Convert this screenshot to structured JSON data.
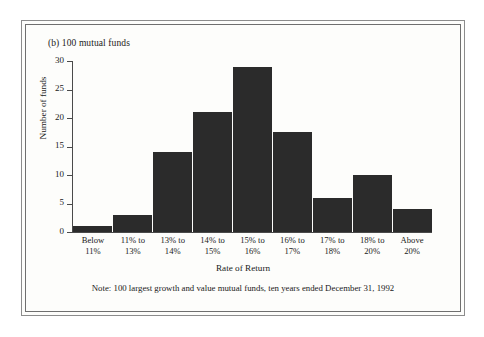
{
  "figure": {
    "panel_title": "(b) 100 mutual funds",
    "note": "Note: 100 largest growth and value mutual funds, ten years ended December 31, 1992"
  },
  "colors": {
    "bar_fill": "#2b2b2b",
    "axis": "#4a4a4a",
    "page_background": "#fdfdfb",
    "frame_rule": "#8c8c8c"
  },
  "chart_data": {
    "type": "bar",
    "title": "(b) 100 mutual funds",
    "xlabel": "Rate of Return",
    "ylabel": "Number of funds",
    "categories": [
      "Below 11%",
      "11% to 13%",
      "13% to 14%",
      "14% to 15%",
      "15% to 16%",
      "16% to 17%",
      "17% to 18%",
      "18% to 20%",
      "Above 20%"
    ],
    "category_lines": [
      [
        "Below",
        "11%"
      ],
      [
        "11% to",
        "13%"
      ],
      [
        "13% to",
        "14%"
      ],
      [
        "14% to",
        "15%"
      ],
      [
        "15% to",
        "16%"
      ],
      [
        "16% to",
        "17%"
      ],
      [
        "17% to",
        "18%"
      ],
      [
        "18% to",
        "20%"
      ],
      [
        "Above",
        "20%"
      ]
    ],
    "values": [
      1,
      3,
      14,
      21,
      29,
      17.5,
      6,
      10,
      4
    ],
    "ylim": [
      0,
      30
    ],
    "yticks": [
      0,
      5,
      10,
      15,
      20,
      25,
      30
    ],
    "ytick_labels": [
      "0",
      "5",
      "10",
      "15",
      "20",
      "25",
      "30"
    ],
    "grid": false,
    "legend": null,
    "annotations": [
      "Note: 100 largest growth and value mutual funds, ten years ended December 31, 1992"
    ]
  }
}
